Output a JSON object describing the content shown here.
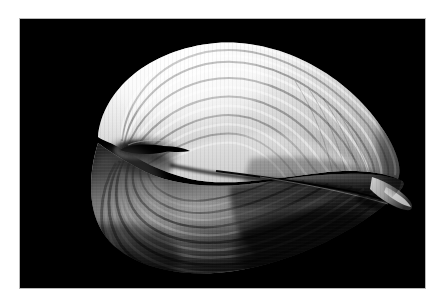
{
  "page": {
    "background_color": "#ffffff",
    "width": 446,
    "height": 304
  },
  "photo": {
    "name": "seashell-photograph",
    "subject": "bivalve seashell",
    "style": "black-and-white studio photograph",
    "background_color": "#000000",
    "frame_border_color": "#b9b9b9",
    "frame": {
      "x": 20,
      "y": 19,
      "width": 405,
      "height": 269
    },
    "alt_text": "Monochrome close-up photograph of a ribbed bivalve seashell lit from the upper left against a pure black background",
    "palette": {
      "highlight": "#ffffff",
      "light": "#e4e4e4",
      "mid": "#a8a8a8",
      "shadow": "#3c3c3c",
      "deep_shadow": "#0a0a0a"
    },
    "subject_bounds": {
      "x": 52,
      "y": 22,
      "width": 330,
      "height": 230
    },
    "features": [
      {
        "id": "upper-valve",
        "label": "upper valve"
      },
      {
        "id": "lower-valve",
        "label": "lower valve"
      },
      {
        "id": "umbo-hinge",
        "label": "umbo / hinge"
      },
      {
        "id": "valve-gap",
        "label": "gap between valves"
      },
      {
        "id": "posterior-tip",
        "label": "posterior tip"
      },
      {
        "id": "growth-ribs",
        "label": "concentric growth ribs"
      }
    ]
  }
}
